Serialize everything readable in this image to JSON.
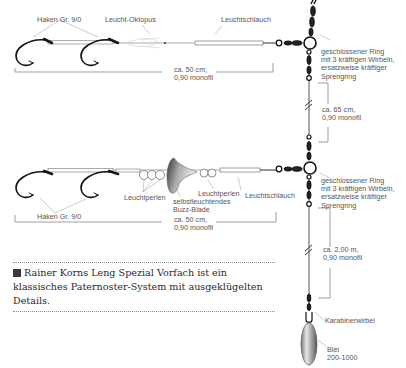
{
  "top_rig": {
    "hooks_label": "Haken Gr. 9/0",
    "octopus_label": "Leucht-Oktopus",
    "tube_label": "Leuchtschlauch",
    "length_line1": "ca. 50 cm,",
    "length_line2": "0,90 monofil",
    "ring_line1": "geschlossener Ring",
    "ring_line2": "mit 3 kräftigen Wirbeln,",
    "ring_line3": "ersatzweise kräftiger",
    "ring_line4": "Sprengring"
  },
  "middle_segment": {
    "length_line1": "ca. 65 cm,",
    "length_line2": "0,90 monofil"
  },
  "bottom_rig": {
    "hooks_label": "Haken Gr. 9/0",
    "beads_label_left": "Leuchtperlen",
    "blade_line1": "selbstleuchtendes",
    "blade_line2": "Buzz-Blade",
    "beads_label_right": "Leuchtperlen",
    "tube_label": "Leuchtschlauch",
    "length_line1": "ca. 50 cm,",
    "length_line2": "0,90 monofil",
    "ring_line1": "geschlossener Ring",
    "ring_line2": "mit 3 kräftigen Wirbeln,",
    "ring_line3": "ersatzweise kräftiger",
    "ring_line4": "Sprengring"
  },
  "lower_segment": {
    "length_line1": "ca. 2,00 m,",
    "length_line2": "0,90 monofil"
  },
  "snap_swivel_label": "Karabinerwirbel",
  "sinker": {
    "line1": "Blei",
    "line2": "200-1000"
  },
  "caption": {
    "text": "Rainer Korns Leng Spezial Vorfach ist ein klassisches Paternoster-System mit ausgeklügelten Details."
  },
  "colors": {
    "line": "#555555",
    "hook": "#1a1a1a",
    "text": "#555555"
  }
}
